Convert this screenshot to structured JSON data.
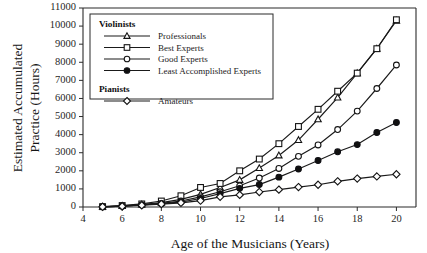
{
  "chart_data": {
    "type": "line",
    "title": "",
    "xlabel": "Age of the Musicians (Years)",
    "ylabel": "Estimated Accumulated Practice (Hours)",
    "xlim": [
      4,
      21
    ],
    "ylim": [
      0,
      11000
    ],
    "xticks": [
      4,
      6,
      8,
      10,
      12,
      14,
      16,
      18,
      20
    ],
    "yticks": [
      0,
      1000,
      2000,
      3000,
      4000,
      5000,
      6000,
      7000,
      8000,
      9000,
      10000,
      11000
    ],
    "grid": false,
    "legend_position": "upper-left-inside",
    "x": [
      5,
      6,
      7,
      8,
      9,
      10,
      11,
      12,
      13,
      14,
      15,
      16,
      17,
      18,
      19,
      20
    ],
    "series": [
      {
        "name": "Professionals",
        "group": "Violinists",
        "marker": "triangle-open",
        "values": [
          15,
          60,
          140,
          240,
          420,
          700,
          1080,
          1500,
          2150,
          2850,
          3700,
          4850,
          6050,
          7400,
          8750,
          10300
        ]
      },
      {
        "name": "Best Experts",
        "group": "Violinists",
        "marker": "square-open",
        "values": [
          20,
          80,
          170,
          330,
          620,
          1080,
          1300,
          2000,
          2650,
          3500,
          4450,
          5400,
          6400,
          7400,
          8750,
          10350
        ]
      },
      {
        "name": "Good Experts",
        "group": "Violinists",
        "marker": "circle-open",
        "values": [
          10,
          50,
          120,
          200,
          330,
          560,
          840,
          1170,
          1600,
          2130,
          2800,
          3430,
          4280,
          5300,
          6550,
          7850
        ]
      },
      {
        "name": "Least Accomplished Experts",
        "group": "Violinists",
        "marker": "circle-filled",
        "values": [
          10,
          45,
          110,
          185,
          270,
          470,
          740,
          1030,
          1240,
          1650,
          2100,
          2570,
          3050,
          3450,
          4120,
          4670
        ]
      },
      {
        "name": "Amateurs",
        "group": "Pianists",
        "marker": "diamond-open",
        "values": [
          10,
          40,
          95,
          160,
          230,
          350,
          560,
          670,
          830,
          960,
          1100,
          1230,
          1420,
          1570,
          1690,
          1810
        ]
      }
    ],
    "legend_groups": [
      {
        "heading": "Violinists",
        "entries": [
          {
            "label": "Professionals",
            "marker": "triangle-open"
          },
          {
            "label": "Best Experts",
            "marker": "square-open"
          },
          {
            "label": "Good Experts",
            "marker": "circle-open"
          },
          {
            "label": "Least Accomplished Experts",
            "marker": "circle-filled"
          }
        ]
      },
      {
        "heading": "Pianists",
        "entries": [
          {
            "label": "Amateurs",
            "marker": "diamond-open"
          }
        ]
      }
    ],
    "colors": {
      "line": "#1a1a1a",
      "marker_fill_open": "#ffffff",
      "marker_fill_closed": "#101010",
      "axis": "#2b2b2b",
      "background": "#ffffff"
    }
  }
}
